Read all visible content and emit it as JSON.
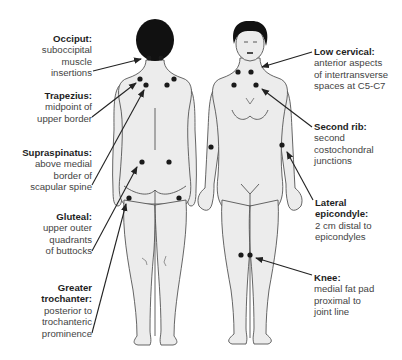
{
  "figure": {
    "views": [
      "posterior",
      "anterior"
    ],
    "colors": {
      "skin": "#ececec",
      "outline": "#555555",
      "hair": "#111111",
      "dot": "#1a1a1a",
      "leader": "#222222",
      "title_text": "#1e1e1e",
      "body_text": "#444444"
    }
  },
  "labels": {
    "occiput": {
      "title": "Occiput:",
      "lines": [
        "suboccipital",
        "muscle",
        "insertions"
      ]
    },
    "trapezius": {
      "title": "Trapezius:",
      "lines": [
        "midpoint of",
        "upper border"
      ]
    },
    "supraspinatus": {
      "title": "Supraspinatus:",
      "lines": [
        "above medial",
        "border of",
        "scapular spine"
      ]
    },
    "gluteal": {
      "title": "Gluteal:",
      "lines": [
        "upper outer",
        "quadrants",
        "of buttocks"
      ]
    },
    "greater_trochanter": {
      "title": "Greater trochanter:",
      "title_lines": [
        "Greater",
        "trochanter:"
      ],
      "lines": [
        "posterior to",
        "trochanteric",
        "prominence"
      ]
    },
    "low_cervical": {
      "title": "Low cervical:",
      "lines": [
        "anterior aspects",
        "of intertransverse",
        "spaces at C5-C7"
      ]
    },
    "second_rib": {
      "title": "Second rib:",
      "lines": [
        "second",
        "costochondral",
        "junctions"
      ]
    },
    "lateral_epicondyle": {
      "title": "Lateral epicondyle:",
      "title_lines": [
        "Lateral",
        "epicondyle:"
      ],
      "lines": [
        "2 cm distal to",
        "epicondyles"
      ]
    },
    "knee": {
      "title": "Knee:",
      "lines": [
        "medial fat pad",
        "proximal to",
        "joint line"
      ]
    }
  }
}
